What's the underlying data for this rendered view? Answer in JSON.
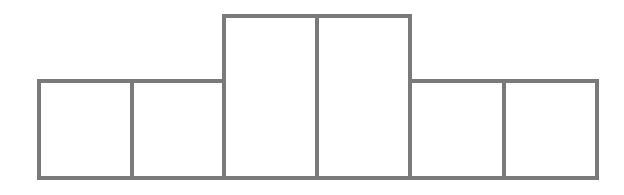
{
  "diagram": {
    "type": "block-outline",
    "stroke_color": "#7a7a7a",
    "background": "#ffffff",
    "boxes": [
      {
        "x": 37,
        "y": 79,
        "w": 97,
        "h": 101
      },
      {
        "x": 130,
        "y": 79,
        "w": 96,
        "h": 101
      },
      {
        "x": 222,
        "y": 14,
        "w": 97,
        "h": 166
      },
      {
        "x": 315,
        "y": 14,
        "w": 97,
        "h": 166
      },
      {
        "x": 408,
        "y": 79,
        "w": 98,
        "h": 101
      },
      {
        "x": 502,
        "y": 79,
        "w": 97,
        "h": 101
      }
    ]
  }
}
